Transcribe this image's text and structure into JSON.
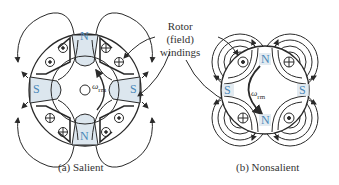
{
  "annotation": {
    "line1": "Rotor",
    "line2": "(field)",
    "line3": "windings"
  },
  "salient": {
    "caption": "(a) Salient",
    "poles": [
      "N",
      "S",
      "S",
      "N"
    ],
    "speed_symbol": "ω",
    "speed_sub": "rm"
  },
  "nonsalient": {
    "caption": "(b) Nonsalient",
    "poles": [
      "N",
      "S",
      "S",
      "N"
    ],
    "speed_symbol": "ω",
    "speed_sub": "rm"
  },
  "colors": {
    "line": "#2a2a2a",
    "pole_fill": "#dce6ee",
    "pole_text": "#4a86b8"
  }
}
